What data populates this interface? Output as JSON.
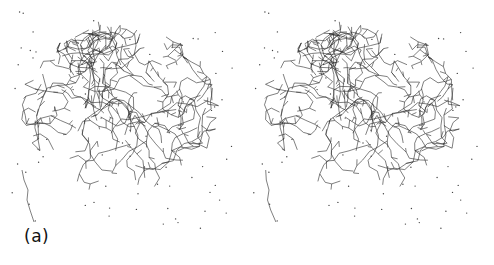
{
  "figure": {
    "panel_label": "(a)",
    "type": "stereo-pair molecular structure wireframe",
    "views": [
      {
        "id": "left",
        "label": "left-eye view"
      },
      {
        "id": "right",
        "label": "right-eye view"
      }
    ],
    "colors": {
      "background": "#ffffff",
      "bond_line": "#2a2a2a",
      "water_dot": "#444444",
      "label_text": "#111111"
    }
  }
}
